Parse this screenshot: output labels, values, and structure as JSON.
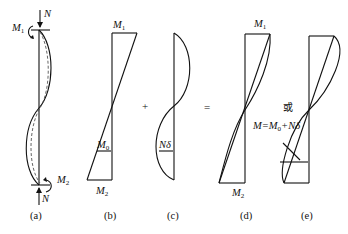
{
  "figure": {
    "panels": [
      {
        "id": "a",
        "caption": "(a)",
        "labels": {
          "top_force": "N",
          "top_moment": "M",
          "top_moment_sub": "1",
          "bottom_moment": "M",
          "bottom_moment_sub": "2",
          "bottom_force": "N"
        }
      },
      {
        "id": "b",
        "caption": "(b)",
        "labels": {
          "top": "M",
          "top_sub": "1",
          "bottom": "M",
          "bottom_sub": "2",
          "mid": "M",
          "mid_sub": "0"
        }
      },
      {
        "id": "c",
        "caption": "(c)",
        "labels": {
          "mid": "Nδ"
        }
      },
      {
        "id": "d",
        "caption": "(d)",
        "labels": {
          "top": "M",
          "top_sub": "1",
          "bottom": "M",
          "bottom_sub": "2"
        }
      },
      {
        "id": "e",
        "caption": "(e)",
        "labels": {
          "or": "或",
          "formula_a": "M=M",
          "formula_sub": "0",
          "formula_b": "+Nδ"
        }
      }
    ],
    "operators": {
      "plus": "+",
      "equals": "="
    }
  }
}
